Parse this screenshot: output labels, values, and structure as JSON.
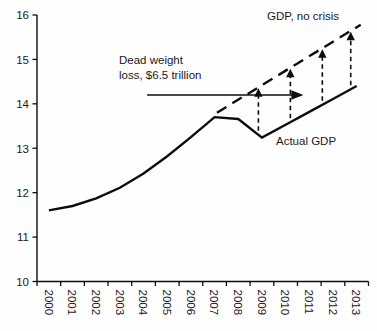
{
  "chart_data": {
    "type": "line",
    "title": "",
    "xlabel": "",
    "ylabel": "",
    "categories": [
      "2000",
      "2001",
      "2002",
      "2003",
      "2004",
      "2005",
      "2006",
      "2007",
      "2008",
      "2009",
      "2010",
      "2011",
      "2012",
      "2013"
    ],
    "yticks": [
      10,
      11,
      12,
      13,
      14,
      15,
      16
    ],
    "ylim": [
      10,
      16
    ],
    "grid": false,
    "legend_position": "inline-labels",
    "series": [
      {
        "name": "Actual GDP",
        "line_style": "solid",
        "color": "#0d0d0d",
        "x": [
          2000,
          2001,
          2002,
          2003,
          2004,
          2005,
          2006,
          2007,
          2008,
          2009,
          2010,
          2011,
          2012,
          2013
        ],
        "values": [
          11.6,
          11.7,
          11.87,
          12.11,
          12.43,
          12.82,
          13.25,
          13.7,
          13.66,
          13.24,
          13.53,
          13.82,
          14.11,
          14.4
        ]
      },
      {
        "name": "GDP, no crisis",
        "line_style": "dashed",
        "color": "#0d0d0d",
        "x": [
          2007.1,
          2013.17
        ],
        "values": [
          13.8,
          15.78
        ]
      }
    ],
    "gap_arrows": {
      "description": "vertical dashed arrows from Actual GDP up to GDP-no-crisis trend",
      "years": [
        2008.85,
        2010.2,
        2011.55,
        2012.75
      ]
    },
    "annotations": {
      "no_crisis_label": "GDP, no crisis",
      "actual_label": "Actual GDP",
      "deadweight": {
        "text": "Dead weight loss, $6.5 trillion",
        "lines": [
          "Dead weight",
          "loss, $6.5 trillion"
        ],
        "arrow_y_value": 14.2,
        "arrow_x_years": [
          2004.15,
          2010.75
        ]
      }
    }
  },
  "colors": {
    "ink": "#1a1a1a",
    "line": "#0d0d0d",
    "background": "#fefefe"
  }
}
